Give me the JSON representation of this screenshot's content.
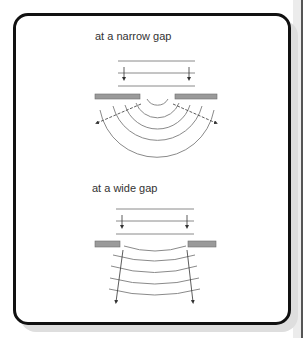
{
  "figure": {
    "panels": [
      {
        "id": "narrow",
        "caption": "at a narrow gap",
        "incident_wavefronts": 3,
        "diffracted_wavefronts": 5,
        "wavefront_shape": "circular",
        "spreading": "strong"
      },
      {
        "id": "wide",
        "caption": "at a wide gap",
        "incident_wavefronts": 3,
        "diffracted_wavefronts": 5,
        "wavefront_shape": "nearly straight",
        "spreading": "slight"
      }
    ],
    "colors": {
      "frame": "#111111",
      "wave_line": "#8a8a8a",
      "barrier_fill": "#9a9a9a",
      "barrier_stroke": "#6e6e6e",
      "ray": "#333333",
      "text": "#333333"
    }
  }
}
